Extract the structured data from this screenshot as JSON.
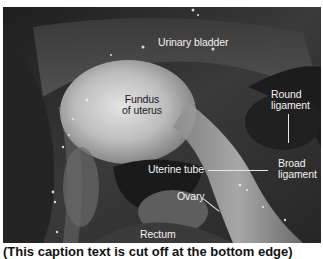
{
  "figure": {
    "type": "labeled anatomical photograph",
    "labels": [
      {
        "id": "urinary-bladder",
        "text": "Urinary bladder"
      },
      {
        "id": "fundus-of-uterus",
        "line1": "Fundus",
        "line2": "of uterus"
      },
      {
        "id": "round-ligament",
        "line1": "Round",
        "line2": "ligament"
      },
      {
        "id": "broad-ligament",
        "line1": "Broad",
        "line2": "ligament"
      },
      {
        "id": "uterine-tube",
        "text": "Uterine tube"
      },
      {
        "id": "ovary",
        "text": "Ovary"
      },
      {
        "id": "rectum",
        "text": "Rectum"
      }
    ],
    "caption_truncated": "(This caption text is cut off at the bottom edge)"
  },
  "colors": {
    "label_light": "#f2f2f2",
    "label_dark": "#1a1a1a",
    "background": "#ffffff"
  }
}
